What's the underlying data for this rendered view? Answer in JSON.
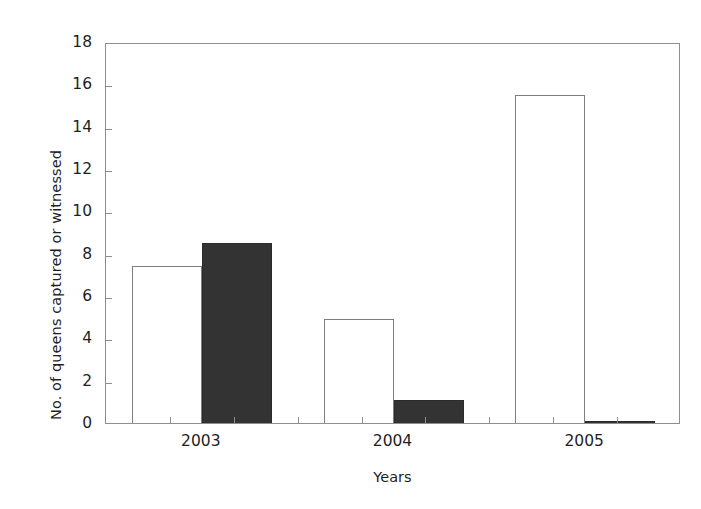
{
  "chart_data": {
    "type": "bar",
    "title": "",
    "subtitle": "",
    "xlabel": "Years",
    "ylabel": "No. of queens captured or witnessed",
    "categories": [
      "2003",
      "2004",
      "2005"
    ],
    "series": [
      {
        "name": "open-bar-series",
        "fill": "#ffffff",
        "edge": "#7d7d7d",
        "values": [
          7.4,
          4.9,
          15.5
        ]
      },
      {
        "name": "filled-bar-series",
        "fill": "#333333",
        "edge": "#2b2b2b",
        "values": [
          8.5,
          1.1,
          0.1
        ]
      }
    ],
    "ylim": [
      0,
      18
    ],
    "ytick_step": 2,
    "yticks": [
      0,
      2,
      4,
      6,
      8,
      10,
      12,
      14,
      16,
      18
    ],
    "ytick_labels": [
      "0",
      "2",
      "4",
      "6",
      "8",
      "10",
      "12",
      "14",
      "16",
      "18"
    ],
    "grid": false,
    "legend": null,
    "legend_position": "none",
    "frame": "box",
    "background_color": "#ffffff",
    "axis_color": "#8e8e8e",
    "text_color": "#1f1f1f"
  }
}
